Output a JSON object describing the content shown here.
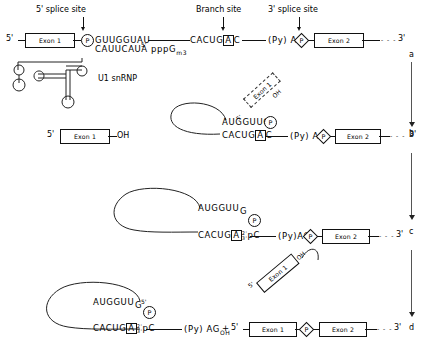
{
  "figure": {
    "stage_labels": [
      "a",
      "b",
      "c",
      "d"
    ],
    "ink_color": "#111111"
  },
  "site_labels": [
    {
      "name": "five-prime-splice-site",
      "text": "5' splice site"
    },
    {
      "name": "branch-site",
      "text": "Branch site"
    },
    {
      "name": "three-prime-splice-site",
      "text": "3' splice site"
    }
  ],
  "common": {
    "five_prime": "5'",
    "three_prime": "3'",
    "exon1": "Exon 1",
    "exon2": "Exon 2",
    "phosphate": "P",
    "oh": "OH",
    "py_ag": "(Py) AG",
    "plus": "+",
    "dashes": "- - -"
  },
  "row_a": {
    "five_prime": "5'",
    "exon1": "Exon 1",
    "phosphate": "P",
    "donor_seq": "GUUGGUAU",
    "u1_seq": "CAUUCAUA pppG",
    "u1_seq_sub": "m",
    "u1_seq_sub2": "3",
    "u1_seq_prime": "5'",
    "u1_label": "U1 snRNP",
    "branch_seq_pre": "CACUG",
    "branch_base": "A",
    "branch_seq_post": "C",
    "py_ag": "(Py) AG",
    "phosphate2": "P",
    "exon2": "Exon 2",
    "dashes": "- - -",
    "three_prime": "3'"
  },
  "row_b": {
    "five_prime": "5'",
    "exon1": "Exon 1",
    "oh": "OH",
    "lariat_top": "AUGGUUG",
    "phosphate": "P",
    "lariat_bottom_pre": "CACUG",
    "branch_base": "A",
    "lariat_bottom_post": "C",
    "py_ag": "(Py) AG",
    "phosphate2": "P",
    "exon2": "Exon 2",
    "dashes": "- - -",
    "three_prime": "3'",
    "free_exon1": "Exon 1",
    "free_exon1_five": "5'",
    "free_exon1_oh": "OH"
  },
  "row_c": {
    "lariat_top": "AUGGUU",
    "lariat_top_g": "G",
    "phosphate": "P",
    "lariat_bottom_pre": "CACUG",
    "branch_base": "A",
    "frac_top": "2'",
    "frac_bottom": "3'",
    "lariat_bottom_post": "pC",
    "py_ag": "(Py)AG",
    "phosphate2": "P",
    "exon2": "Exon 2",
    "dashes": "- - -",
    "three_prime": "3'",
    "free_exon1": "Exon 1",
    "free_exon1_five": "5'",
    "free_exon1_oh": "OH"
  },
  "row_d": {
    "lariat_top": "AUGGUU",
    "lariat_top_g": "G",
    "lariat_top_g_prime": "5'",
    "phosphate": "P",
    "lariat_bottom_pre": "CACUG",
    "branch_base": "A",
    "frac_top": "2'",
    "frac_bottom": "3'",
    "lariat_bottom_post": "pC",
    "py_ag": "(Py) AG",
    "py_ag_sub": "OH",
    "plus": "+",
    "five_prime": "5'",
    "exon1": "Exon 1",
    "phosphate2": "P",
    "exon2": "Exon 2",
    "dashes": "- - -",
    "three_prime": "3'"
  }
}
